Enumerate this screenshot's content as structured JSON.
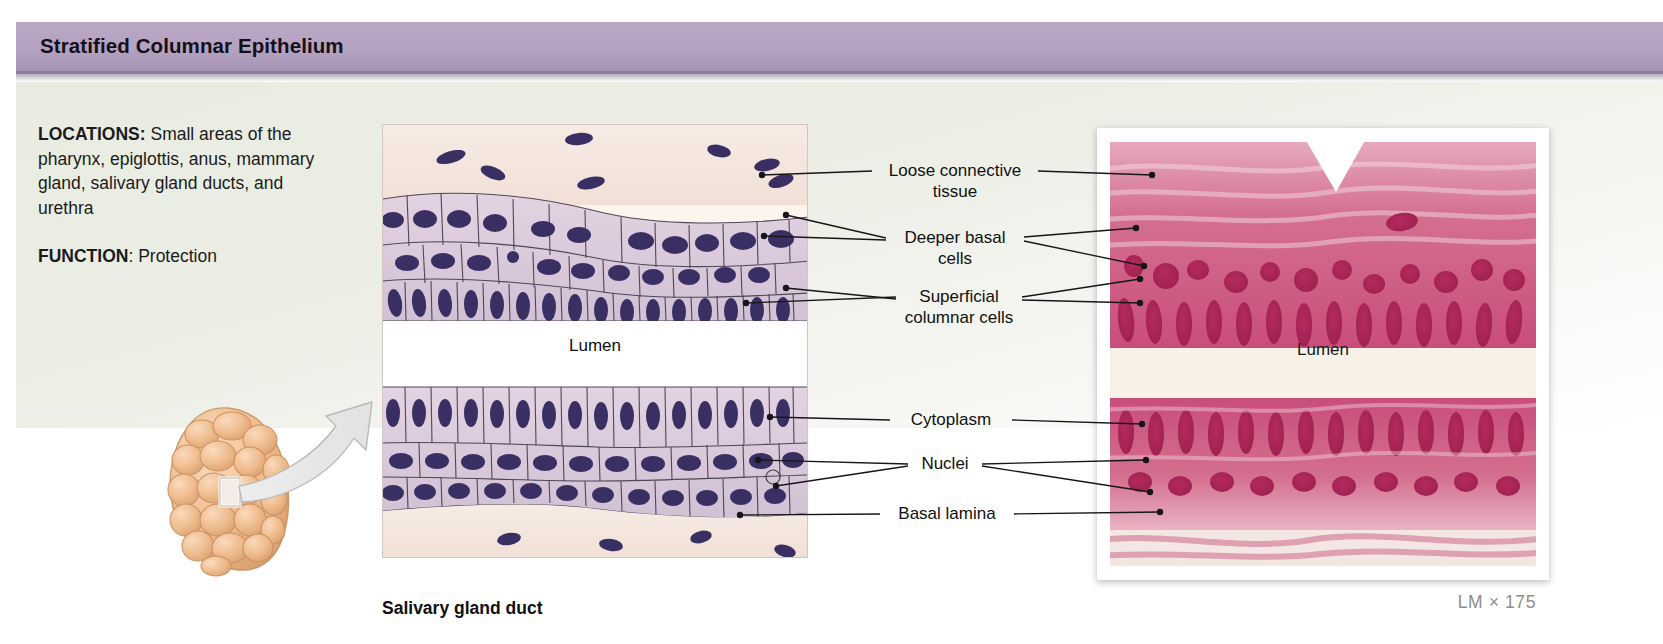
{
  "header": {
    "title": "Stratified Columnar Epithelium",
    "bar_color": "#b3a0bf"
  },
  "info": {
    "locations_label": "LOCATIONS:",
    "locations_text": " Small areas of the pharynx, epiglottis, anus, mammary gland, salivary gland ducts, and urethra",
    "function_label": "FUNCTION",
    "function_text": ": Protection"
  },
  "diagram": {
    "caption": "Salivary gland duct",
    "lumen_label": "Lumen"
  },
  "micrograph": {
    "lumen_label": "Lumen",
    "magnification": "LM × 175"
  },
  "labels": [
    {
      "name": "loose-connective-tissue",
      "text": "Loose connective\ntissue"
    },
    {
      "name": "deeper-basal-cells",
      "text": "Deeper basal\ncells"
    },
    {
      "name": "superficial-columnar-cells",
      "text": "Superficial\ncolumnar cells"
    },
    {
      "name": "cytoplasm",
      "text": "Cytoplasm"
    },
    {
      "name": "nuclei",
      "text": "Nuclei"
    },
    {
      "name": "basal-lamina",
      "text": "Basal lamina"
    }
  ],
  "colors": {
    "title_bar": "#b3a0bf",
    "panel_bg": "#eceee5",
    "cell_fill": "#ded0de",
    "nucleus": "#3a2f63",
    "gland": "#edb98a",
    "micrograph_pink": "#cf4d80"
  }
}
